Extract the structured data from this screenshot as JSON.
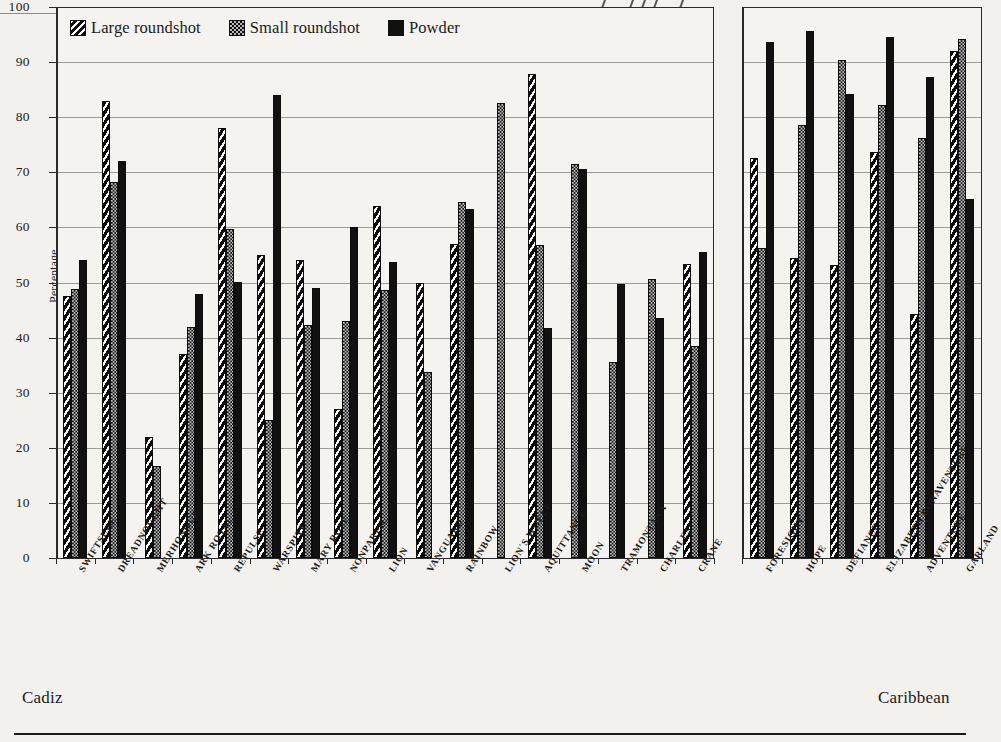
{
  "chart_data": {
    "type": "bar",
    "title": "",
    "subtitle": "",
    "xlabel": "",
    "ylabel": "Percentage",
    "ylim": [
      0,
      100
    ],
    "ytick_step": 10,
    "yticks": [
      "0",
      "10",
      "20",
      "30",
      "40",
      "50",
      "60",
      "70",
      "80",
      "90",
      "100"
    ],
    "grid": true,
    "legend_position": "top-left",
    "orientation": "vertical",
    "group_mode": "grouped",
    "series": [
      {
        "name": "Large roundshot",
        "pattern": "diagonal-hatch",
        "color": "#111111"
      },
      {
        "name": "Small roundshot",
        "pattern": "checker",
        "color": "#bbbbbb"
      },
      {
        "name": "Powder",
        "pattern": "solid",
        "color": "#111111"
      }
    ],
    "panels": [
      {
        "name": "Cadiz",
        "caption": "Cadiz",
        "categories": [
          "SWIFTSURE",
          "DREADNOUGHT",
          "MERHONOUR",
          "ARK ROYAL",
          "REPULSE",
          "WARSPITE",
          "MARY ROSE",
          "NONPAREIL",
          "LION",
          "VANGUARD",
          "RAINBOW",
          "LION´S WHELP",
          "AQUITTANCE",
          "MOON",
          "TRAMONTANA",
          "CHARLES",
          "CRANE"
        ],
        "values": {
          "Large roundshot": [
            47.5,
            83.0,
            22.0,
            37.0,
            78.0,
            55.0,
            54.0,
            27.0,
            63.9,
            50.0,
            57.0,
            null,
            87.8,
            null,
            null,
            null,
            53.3
          ],
          "Small roundshot": [
            48.8,
            68.3,
            16.7,
            42.0,
            59.8,
            25.0,
            42.2,
            43.0,
            48.6,
            33.7,
            64.6,
            82.6,
            56.8,
            71.5,
            35.5,
            50.7,
            38.4
          ],
          "Powder": [
            54.0,
            72.0,
            null,
            48.0,
            50.1,
            84.0,
            49.0,
            60.0,
            53.8,
            null,
            63.4,
            null,
            41.7,
            70.6,
            49.7,
            43.5,
            55.5
          ]
        }
      },
      {
        "name": "Caribbean",
        "caption": "Caribbean",
        "categories": [
          "FORESIGHT",
          "HOPE",
          "DEFIANCE",
          "ELIZABETH BONAVENTURE",
          "ADVENTURE",
          "GARLAND"
        ],
        "values": {
          "Large roundshot": [
            72.6,
            54.5,
            53.2,
            73.6,
            44.3,
            92.1
          ],
          "Small roundshot": [
            56.2,
            78.5,
            90.3,
            82.2,
            76.3,
            94.2
          ],
          "Powder": [
            93.6,
            95.6,
            84.2,
            94.5,
            87.3,
            65.2
          ]
        }
      }
    ]
  },
  "legend": {
    "items": [
      {
        "label": "Large roundshot",
        "swatch": "diagonal-hatch-swatch"
      },
      {
        "label": "Small roundshot",
        "swatch": "checker-swatch"
      },
      {
        "label": "Powder",
        "swatch": "solid-swatch"
      }
    ]
  },
  "axis": {
    "y_title": "Percentage",
    "y_labels": [
      "100",
      "90",
      "80",
      "70",
      "60",
      "50",
      "40",
      "30",
      "20",
      "10",
      "0"
    ]
  },
  "captions": {
    "left": "Cadiz",
    "right": "Caribbean"
  }
}
